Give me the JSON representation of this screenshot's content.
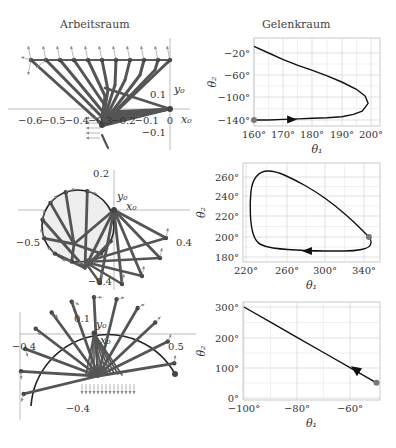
{
  "titles": {
    "left": "Arbeitsraum",
    "right": "Gelenkraum"
  },
  "workspace_panels": [
    {
      "id": "top",
      "x_ticks": [
        "-0.6",
        "-0.5",
        "-0.4",
        "-0.3",
        "-0.2",
        "-0.1",
        "0"
      ],
      "y_ticks": [
        "0.1",
        "-0.1"
      ],
      "axis_labels": {
        "x": "x0",
        "y": "y0"
      }
    },
    {
      "id": "middle",
      "x_ticks": [
        "-0.5",
        "0.4"
      ],
      "y_ticks": [
        "0.2",
        "-0.4"
      ],
      "axis_labels": {
        "x": "x0",
        "y": "y0"
      }
    },
    {
      "id": "bottom",
      "x_ticks": [
        "-0.4",
        "0.5"
      ],
      "y_ticks": [
        "0.1",
        "-0.4"
      ],
      "axis_labels": {
        "x": "x0",
        "y": "y0"
      }
    }
  ],
  "chart_data": [
    {
      "type": "line",
      "title": "Gelenkraum",
      "xlabel": "θ1",
      "ylabel": "θ2",
      "xlim": [
        160,
        203
      ],
      "ylim": [
        -148,
        -10
      ],
      "x_ticks": [
        "160°",
        "170°",
        "180°",
        "190°",
        "200°"
      ],
      "y_ticks": [
        "-20°",
        "-60°",
        "-100°",
        "-140°"
      ],
      "grid": true,
      "series": [
        {
          "name": "trajectory",
          "x": [
            160,
            165,
            170,
            175,
            180,
            185,
            190,
            194,
            197,
            199,
            198,
            195,
            190,
            185,
            180,
            175,
            170,
            165,
            160
          ],
          "y": [
            -140,
            -140,
            -139,
            -138,
            -137,
            -136,
            -134,
            -130,
            -124,
            -110,
            -97,
            -85,
            -72,
            -61,
            -51,
            -42,
            -32,
            -20,
            -8
          ]
        }
      ],
      "start_marker": {
        "x": 160,
        "y": -140
      },
      "arrow": {
        "x": 172,
        "y": -139,
        "direction": "right"
      }
    },
    {
      "type": "line",
      "title": "",
      "xlabel": "θ1",
      "ylabel": "θ2",
      "xlim": [
        218,
        352
      ],
      "ylim": [
        174,
        272
      ],
      "x_ticks": [
        "220°",
        "260°",
        "300°",
        "340°"
      ],
      "y_ticks": [
        "180°",
        "200°",
        "220°",
        "240°",
        "260°"
      ],
      "grid": true,
      "series": [
        {
          "name": "trajectory",
          "x": [
            345,
            330,
            310,
            290,
            270,
            250,
            235,
            226,
            224,
            225,
            230,
            240,
            255,
            270,
            290,
            310,
            330,
            345,
            348,
            345
          ],
          "y": [
            200,
            215,
            232,
            246,
            257,
            266,
            266,
            255,
            235,
            210,
            195,
            190,
            188,
            187,
            186,
            186,
            186,
            189,
            195,
            200
          ]
        }
      ],
      "start_marker": {
        "x": 345,
        "y": 200
      },
      "arrow": {
        "x": 285,
        "y": 186,
        "direction": "left"
      }
    },
    {
      "type": "line",
      "title": "",
      "xlabel": "θ1",
      "ylabel": "θ2",
      "xlim": [
        -100,
        -48
      ],
      "ylim": [
        -10,
        310
      ],
      "x_ticks": [
        "-100°",
        "-80°",
        "-60°"
      ],
      "y_ticks": [
        "0°",
        "100°",
        "200°",
        "300°"
      ],
      "grid": true,
      "series": [
        {
          "name": "trajectory",
          "x": [
            -50,
            -60,
            -70,
            -80,
            -90,
            -100
          ],
          "y": [
            50,
            100,
            150,
            200,
            250,
            300
          ]
        }
      ],
      "start_marker": {
        "x": -50,
        "y": 50
      },
      "arrow": {
        "x": -57,
        "y": 88,
        "direction": "up-left"
      }
    }
  ],
  "colors": {
    "link": "#555555",
    "curve": "#111111",
    "grid": "#cccccc",
    "marker": "#777777",
    "circle_fill": "#eeeeee"
  }
}
